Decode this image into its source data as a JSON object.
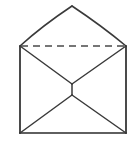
{
  "figure": {
    "name": "open-envelope-diagram",
    "type": "line-drawing",
    "canvas": {
      "width": 139,
      "height": 143
    },
    "colors": {
      "background": "#ffffff",
      "stroke": "#3a3a3a",
      "stroke_dark": "#2b2b2b",
      "dashed_stroke": "#4a4a4a"
    },
    "stroke_width": 1.6,
    "dash_pattern": "7 5",
    "vertices": {
      "flap_apex": {
        "x": 72,
        "y": 6
      },
      "top_left": {
        "x": 20,
        "y": 46
      },
      "top_right": {
        "x": 126,
        "y": 46
      },
      "bottom_left": {
        "x": 20,
        "y": 133
      },
      "bottom_right": {
        "x": 126,
        "y": 133
      },
      "center_upper": {
        "x": 72,
        "y": 84
      },
      "center_lower": {
        "x": 72,
        "y": 95
      }
    },
    "paths": {
      "flap_left": "M 20 46 Q 42 26 72 6",
      "flap_right": "M 72 6 Q 102 26 126 46",
      "fold_line": "M 21 46 L 125 46",
      "body_left": "M 20 46 L 20 133",
      "body_right": "M 126 46 L 126 133",
      "body_bottom": "M 20 133 L 126 133",
      "crease_upper_left": "M 20 46 L 72 84",
      "crease_upper_right": "M 126 46 L 72 84",
      "crease_center": "M 72 84 L 72 95",
      "crease_lower_left": "M 72 95 L 20 133",
      "crease_lower_right": "M 72 95 L 126 133"
    },
    "labels": {
      "title": "",
      "caption": ""
    }
  }
}
